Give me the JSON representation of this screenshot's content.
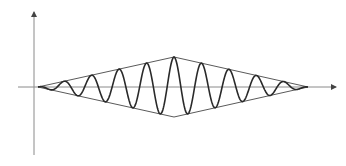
{
  "diagram": {
    "title": "",
    "colors": {
      "background": "#ffffff",
      "axis": "#8a8a8a",
      "envelope": "#5a5a5a",
      "wave": "#2a2a2a"
    },
    "axes": {
      "x_axis": {
        "y": 87,
        "x_start": 18,
        "x_end": 336,
        "arrow": true
      },
      "y_axis": {
        "x": 34,
        "y_start": 155,
        "y_end": 12,
        "arrow": true
      }
    },
    "envelope": {
      "left_apex": [
        38,
        87
      ],
      "top_vertex": [
        174,
        57
      ],
      "right_apex": [
        308,
        87
      ],
      "bottom_vertex": [
        174,
        117
      ]
    },
    "wave": {
      "center_x": 174,
      "baseline_y": 87,
      "peak_amplitude": 30,
      "period_px": 27.5,
      "x_start": 38,
      "x_end": 308
    }
  }
}
